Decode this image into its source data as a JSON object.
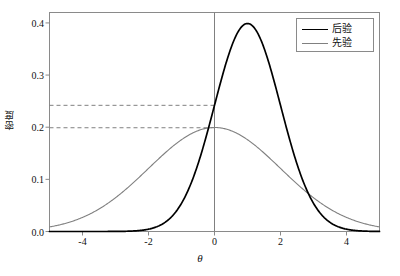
{
  "chart_data": {
    "type": "line",
    "title": "",
    "xlabel": "θ",
    "ylabel": "密度",
    "xlim": [
      -5,
      5
    ],
    "ylim": [
      0,
      0.42
    ],
    "xticks": [
      "-4",
      "-2",
      "0",
      "2",
      "4"
    ],
    "xtick_values": [
      -4,
      -2,
      0,
      2,
      4
    ],
    "yticks": [
      "0.0",
      "0.1",
      "0.2",
      "0.3",
      "0.4"
    ],
    "ytick_values": [
      0.0,
      0.1,
      0.2,
      0.3,
      0.4
    ],
    "grid": false,
    "legend_position": "top-right",
    "series": [
      {
        "name": "后验",
        "color": "#000000",
        "distribution": "normal",
        "mean": 1.0,
        "sd": 1.0,
        "peak": 0.3989,
        "x": [
          -5.0,
          -4.5,
          -4.0,
          -3.5,
          -3.0,
          -2.5,
          -2.0,
          -1.5,
          -1.0,
          -0.5,
          0.0,
          0.5,
          1.0,
          1.5,
          2.0,
          2.5,
          3.0,
          3.5,
          4.0,
          4.5,
          5.0
        ],
        "values": [
          0.0001,
          0.0004,
          0.0015,
          0.0044,
          0.0111,
          0.0246,
          0.0443,
          0.0648,
          0.1295,
          0.1295,
          0.242,
          0.3521,
          0.3989,
          0.3521,
          0.242,
          0.1295,
          0.054,
          0.0175,
          0.0044,
          0.0009,
          0.0001
        ]
      },
      {
        "name": "先验",
        "color": "#808080",
        "distribution": "normal",
        "mean": 0.0,
        "sd": 2.0,
        "peak": 0.1995,
        "x": [
          -5.0,
          -4.5,
          -4.0,
          -3.5,
          -3.0,
          -2.5,
          -2.0,
          -1.5,
          -1.0,
          -0.5,
          0.0,
          0.5,
          1.0,
          1.5,
          2.0,
          2.5,
          3.0,
          3.5,
          4.0,
          4.5,
          5.0
        ],
        "values": [
          0.0088,
          0.0158,
          0.027,
          0.0437,
          0.0648,
          0.0913,
          0.121,
          0.1506,
          0.176,
          0.1933,
          0.1995,
          0.1933,
          0.176,
          0.1506,
          0.121,
          0.0913,
          0.0648,
          0.0437,
          0.027,
          0.0158,
          0.0088
        ]
      }
    ],
    "annotations": {
      "vertical_line": {
        "x": 0,
        "color": "#808080"
      },
      "dashed_lines": [
        {
          "y": 0.242,
          "color": "#808080",
          "style": "dashed",
          "from_x": -5,
          "to_x": 0
        },
        {
          "y": 0.199,
          "color": "#808080",
          "style": "dashed",
          "from_x": -5,
          "to_x": 0
        }
      ]
    }
  },
  "legend": {
    "entries": [
      {
        "label": "后验",
        "color": "#000000"
      },
      {
        "label": "先验",
        "color": "#808080"
      }
    ]
  },
  "axes": {
    "frame_color": "#8a8a8a",
    "tick_color": "#8a8a8a"
  }
}
